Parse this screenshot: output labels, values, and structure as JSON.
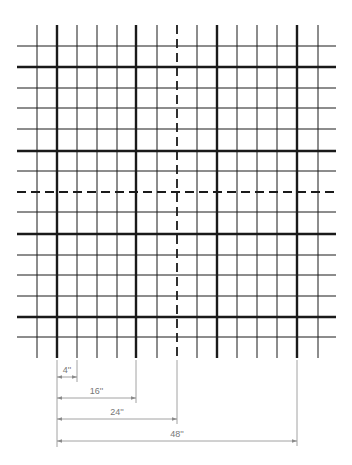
{
  "diagram": {
    "type": "grid-layout-with-dimensions",
    "grid": {
      "vertical_lines_x": [
        37,
        57,
        77,
        97,
        117,
        136,
        157,
        177,
        197,
        217,
        237,
        257,
        277,
        297,
        318
      ],
      "vertical_styles": [
        "thin",
        "thick",
        "thin",
        "thin",
        "thin",
        "thick",
        "thin",
        "dashed",
        "thin",
        "thick",
        "thin",
        "thin",
        "thin",
        "thick",
        "thin"
      ],
      "vertical_span": [
        25,
        358
      ],
      "horizontal_lines_y": [
        46,
        67,
        88,
        108,
        129,
        151,
        171,
        192,
        212,
        234,
        255,
        275,
        296,
        317,
        337
      ],
      "horizontal_styles": [
        "thin",
        "thick",
        "thin",
        "thin",
        "thin",
        "thick",
        "thin",
        "dashed",
        "thin",
        "thick",
        "thin",
        "thin",
        "thin",
        "thick",
        "thin"
      ],
      "horizontal_span": [
        17,
        336
      ],
      "line_color": "#1a1a1a"
    },
    "dimensions": [
      {
        "label": "4''",
        "x1": 57,
        "x2": 77,
        "y": 377
      },
      {
        "label": "16''",
        "x1": 57,
        "x2": 136,
        "y": 398
      },
      {
        "label": "24''",
        "x1": 57,
        "x2": 177,
        "y": 419
      },
      {
        "label": "48''",
        "x1": 57,
        "x2": 297,
        "y": 441
      }
    ],
    "dimension_color": "#8a8a8a"
  }
}
